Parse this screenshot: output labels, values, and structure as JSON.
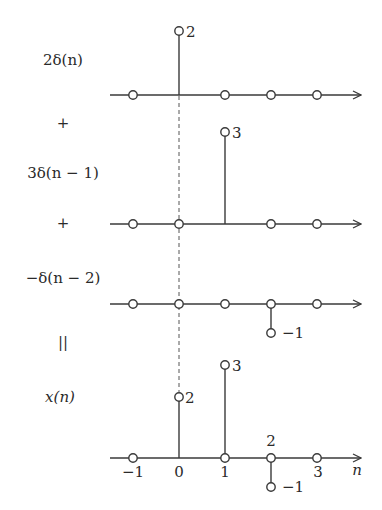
{
  "diagram": {
    "rows": [
      {
        "label": "2δ(n)",
        "operator_after": "+",
        "impulses": [
          {
            "n": 0,
            "value": 2,
            "label": "2"
          }
        ],
        "samples": [
          -1,
          0,
          1,
          2,
          3
        ]
      },
      {
        "label": "3δ(n − 1)",
        "operator_after": "+",
        "impulses": [
          {
            "n": 1,
            "value": 3,
            "label": "3"
          }
        ],
        "samples": [
          -1,
          0,
          1,
          2,
          3
        ]
      },
      {
        "label": "−δ(n − 2)",
        "operator_after": "||",
        "impulses": [
          {
            "n": 2,
            "value": -1,
            "label": "−1"
          }
        ],
        "samples": [
          -1,
          0,
          1,
          2,
          3
        ]
      },
      {
        "label": "x(n)",
        "impulses": [
          {
            "n": 0,
            "value": 2,
            "label": "2"
          },
          {
            "n": 1,
            "value": 3,
            "label": "3"
          },
          {
            "n": 2,
            "value": -1,
            "label": "−1"
          }
        ],
        "samples": [
          -1,
          0,
          1,
          2,
          3
        ],
        "tick_labels": [
          "−1",
          "0",
          "1",
          "2",
          "3"
        ],
        "axis_label": "n"
      }
    ],
    "operators": {
      "plus1": "+",
      "plus2": "+",
      "equals": "||"
    },
    "labels": {
      "row1": "2δ(n)",
      "row2": "3δ(n − 1)",
      "row3": "−δ(n − 2)",
      "row4": "x(n)",
      "val_row1": "2",
      "val_row2": "3",
      "val_row3": "−1",
      "val_row4_n0": "2",
      "val_row4_n1": "3",
      "val_row4_n2": "−1",
      "tick_m1": "−1",
      "tick_0": "0",
      "tick_1": "1",
      "tick_2": "2",
      "tick_3": "3",
      "axis_n": "n"
    },
    "colors": {
      "ink": "#2a2a2a",
      "background": "#ffffff"
    }
  }
}
